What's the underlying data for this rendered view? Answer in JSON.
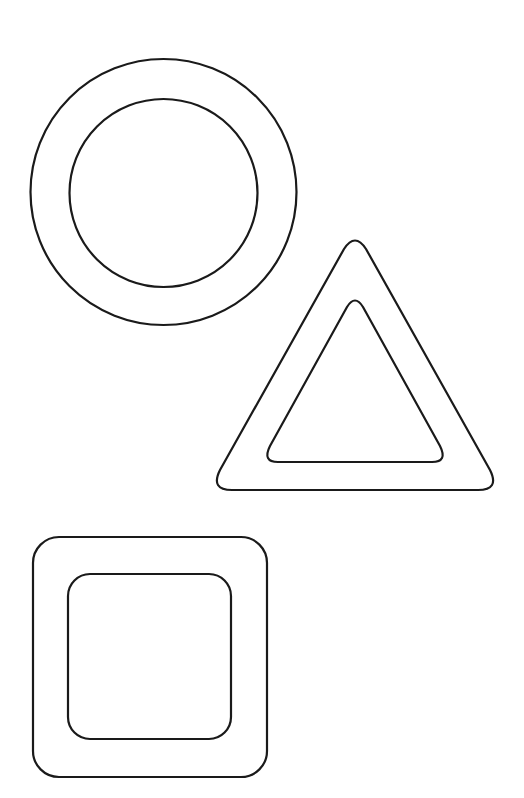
{
  "colors": {
    "background": "#ffffff",
    "stroke": "#1a1a1a"
  },
  "shapes": [
    {
      "name": "ring",
      "kind": "circle",
      "outline": "double"
    },
    {
      "name": "triangle",
      "kind": "triangle",
      "outline": "double"
    },
    {
      "name": "square",
      "kind": "rounded-square",
      "outline": "double"
    }
  ]
}
